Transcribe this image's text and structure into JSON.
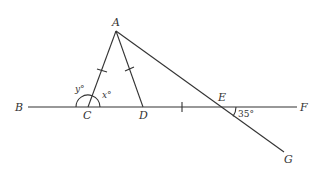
{
  "diagram": {
    "points": {
      "A": {
        "label": "A",
        "x": 116,
        "y": 31
      },
      "B": {
        "label": "B",
        "x": 28,
        "y": 107
      },
      "C": {
        "label": "C",
        "x": 88,
        "y": 107
      },
      "D": {
        "label": "D",
        "x": 143,
        "y": 107
      },
      "E": {
        "label": "E",
        "x": 220,
        "y": 107
      },
      "F": {
        "label": "F",
        "x": 297,
        "y": 107
      },
      "G": {
        "label": "G",
        "x": 284,
        "y": 152
      }
    },
    "angles": {
      "y": "y°",
      "x": "x°",
      "E": "35°"
    },
    "stroke_color": "#333333"
  }
}
